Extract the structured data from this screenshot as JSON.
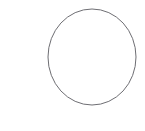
{
  "canvas": {
    "width": 145,
    "height": 131,
    "background_color": "#ffffff"
  },
  "shape": {
    "name": "circle-outline",
    "kind": "ellipse",
    "center_x": 92,
    "center_y": 57,
    "radius_x": 44,
    "radius_y": 48,
    "stroke_color": "#6e6e73",
    "stroke_width": 1,
    "fill": "none"
  },
  "labels": {
    "title": "",
    "caption": ""
  }
}
